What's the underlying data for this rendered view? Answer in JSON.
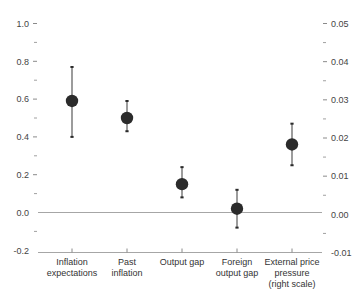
{
  "chart_data": {
    "type": "scatter",
    "title": "",
    "subtitle": "",
    "xlabel": "",
    "ylabel": "",
    "ylabel_right": "",
    "categories": [
      "Inflation expectations",
      "Past inflation",
      "Output gap",
      "Foreign output gap",
      "External price pressure (right scale)"
    ],
    "category_lines": [
      [
        "Inflation",
        "expectations"
      ],
      [
        "Past",
        "inflation"
      ],
      [
        "Output gap"
      ],
      [
        "Foreign",
        "output gap"
      ],
      [
        "External price",
        "pressure",
        "(right scale)"
      ]
    ],
    "series": [
      {
        "name": "Coefficient estimate",
        "values": [
          0.59,
          0.5,
          0.15,
          0.02,
          0.36
        ],
        "ci_low": [
          0.4,
          0.43,
          0.08,
          -0.08,
          0.25
        ],
        "ci_high": [
          0.77,
          0.59,
          0.24,
          0.12,
          0.47
        ],
        "axis": [
          "left",
          "left",
          "left",
          "left",
          "right"
        ]
      }
    ],
    "right_scale_values": [
      null,
      null,
      null,
      null,
      0.018
    ],
    "right_scale_ci_low": [
      null,
      null,
      null,
      null,
      0.0125
    ],
    "right_scale_ci_high": [
      null,
      null,
      null,
      null,
      0.0235
    ],
    "ylim": [
      -0.2,
      1.0
    ],
    "ylim_right": [
      -0.01,
      0.05
    ],
    "ytick_labels": [
      "1.0",
      "0.8",
      "0.6",
      "0.4",
      "0.2",
      "0.0",
      "-0.2"
    ],
    "ytick_values": [
      1.0,
      0.8,
      0.6,
      0.4,
      0.2,
      0.0,
      -0.2
    ],
    "ytick_labels_right": [
      "0.05",
      "0.04",
      "0.03",
      "0.02",
      "0.01",
      "0.00",
      "-0.01"
    ],
    "ytick_values_right": [
      0.05,
      0.04,
      0.03,
      0.02,
      0.01,
      0.0,
      -0.01
    ],
    "minor_ticks": [
      0.9,
      0.7,
      0.5,
      0.3,
      0.1,
      -0.1
    ],
    "minor_ticks_right": [
      0.045,
      0.035,
      0.025,
      0.015,
      0.005,
      -0.005
    ],
    "grid": false,
    "zero_line": true,
    "legend": "none",
    "marker_color": "#2b2b2b",
    "errorbar_color": "#5a5a5a",
    "axis_color": "#a6a6a6"
  }
}
